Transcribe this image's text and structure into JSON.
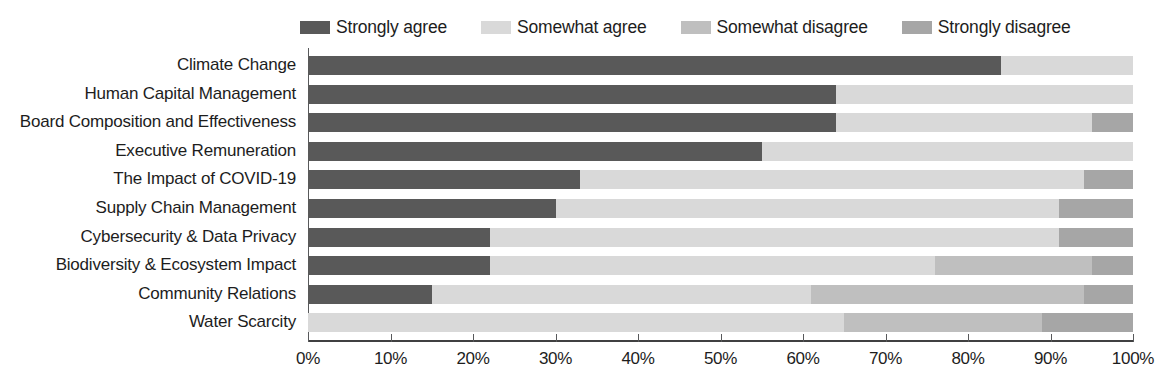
{
  "chart_data": {
    "type": "bar",
    "subtype": "stacked-horizontal-100",
    "title": "",
    "subtitle": "",
    "xlabel": "",
    "ylabel": "",
    "grid": false,
    "legend_position": "top",
    "xlim": [
      0,
      100
    ],
    "xticks": [
      0,
      10,
      20,
      30,
      40,
      50,
      60,
      70,
      80,
      90,
      100
    ],
    "xticklabels": [
      "0%",
      "10%",
      "20%",
      "30%",
      "40%",
      "50%",
      "60%",
      "70%",
      "80%",
      "90%",
      "100%"
    ],
    "categories": [
      "Climate Change",
      "Human Capital Management",
      "Board Composition and Effectiveness",
      "Executive Remuneration",
      "The Impact of COVID-19",
      "Supply Chain Management",
      "Cybersecurity & Data Privacy",
      "Biodiversity & Ecosystem Impact",
      "Community Relations",
      "Water Scarcity"
    ],
    "series": [
      {
        "name": "Strongly agree",
        "color": "#595959",
        "values": [
          84,
          64,
          64,
          55,
          33,
          30,
          22,
          22,
          15,
          0
        ]
      },
      {
        "name": "Somewhat agree",
        "color": "#d9d9d9",
        "values": [
          16,
          36,
          31,
          45,
          61,
          61,
          69,
          54,
          46,
          65
        ]
      },
      {
        "name": "Somewhat disagree",
        "color": "#bfbfbf",
        "values": [
          0,
          0,
          0,
          0,
          0,
          0,
          0,
          19,
          33,
          24
        ]
      },
      {
        "name": "Strongly disagree",
        "color": "#a6a6a6",
        "values": [
          0,
          0,
          5,
          0,
          6,
          9,
          9,
          5,
          6,
          11
        ]
      }
    ]
  },
  "legend": {
    "items": [
      {
        "label": "Strongly agree",
        "color": "#595959"
      },
      {
        "label": "Somewhat agree",
        "color": "#d9d9d9"
      },
      {
        "label": "Somewhat disagree",
        "color": "#bfbfbf"
      },
      {
        "label": "Strongly disagree",
        "color": "#a6a6a6"
      }
    ]
  }
}
